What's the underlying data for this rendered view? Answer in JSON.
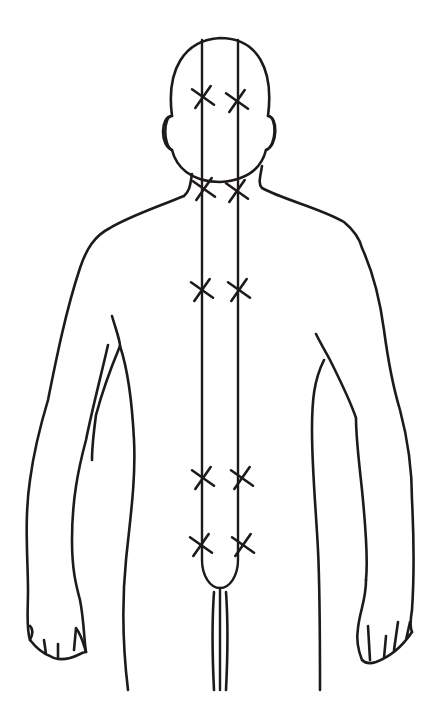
{
  "figure": {
    "title": "",
    "view": "posterior",
    "background": "#ffffff",
    "ink": "#1e1a1a"
  },
  "meridian_lines": {
    "left_x": 202,
    "right_x": 238,
    "top_y": 40,
    "bottom_y": 560,
    "join_bottom_y": 588,
    "tail_end_y": 690
  },
  "markers": [
    {
      "id": "head-left",
      "x": 203,
      "y": 97
    },
    {
      "id": "head-right",
      "x": 237,
      "y": 101
    },
    {
      "id": "neck-left",
      "x": 204,
      "y": 189
    },
    {
      "id": "neck-right",
      "x": 237,
      "y": 191
    },
    {
      "id": "upper-back-left",
      "x": 202,
      "y": 290
    },
    {
      "id": "upper-back-right",
      "x": 239,
      "y": 290
    },
    {
      "id": "lower-back-left",
      "x": 203,
      "y": 478
    },
    {
      "id": "lower-back-right",
      "x": 242,
      "y": 478
    },
    {
      "id": "sacral-left",
      "x": 201,
      "y": 545
    },
    {
      "id": "sacral-right",
      "x": 243,
      "y": 545
    }
  ]
}
